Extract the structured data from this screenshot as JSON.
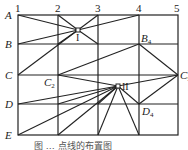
{
  "diagram": {
    "columns": [
      "1",
      "2",
      "3",
      "4",
      "5"
    ],
    "rows": [
      "A",
      "B",
      "C",
      "D",
      "E"
    ],
    "points": {
      "I": "I",
      "II": "II",
      "B4": {
        "base": "B",
        "sub": "4"
      },
      "C2": {
        "base": "C",
        "sub": "2"
      },
      "C5": {
        "base": "C",
        "sub": "5"
      },
      "D4": {
        "base": "D",
        "sub": "4"
      }
    },
    "caption": "图 … 点线的布置图"
  }
}
